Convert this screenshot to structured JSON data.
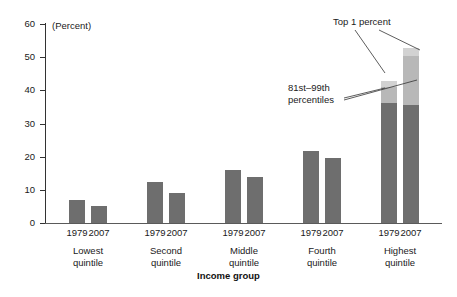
{
  "chart_data": {
    "type": "bar",
    "title": "",
    "subtitle": "",
    "unit_label": "(Percent)",
    "xlabel": "Income group",
    "ylabel": "",
    "ylim": [
      0,
      60
    ],
    "yticks": [
      0,
      10,
      20,
      30,
      40,
      50,
      60
    ],
    "ytick_labels": [
      "0",
      "10",
      "20",
      "30",
      "40",
      "50",
      "60"
    ],
    "grid": false,
    "legend_position": "annotations",
    "categories": [
      "Lowest quintile",
      "Second quintile",
      "Middle quintile",
      "Fourth quintile",
      "Highest quintile"
    ],
    "category_lines": [
      [
        "Lowest",
        "quintile"
      ],
      [
        "Second",
        "quintile"
      ],
      [
        "Middle",
        "quintile"
      ],
      [
        "Fourth",
        "quintile"
      ],
      [
        "Highest",
        "quintile"
      ]
    ],
    "year_labels": [
      "1979",
      "2007"
    ],
    "stack_segments": [
      "1st-80th percentiles",
      "81st-99th percentiles",
      "Top 1 percent"
    ],
    "annotations": [
      {
        "id": "top-1-percent",
        "text": "Top 1 percent"
      },
      {
        "id": "81st-99th-percentiles",
        "line1": "81st–99th",
        "line2": "percentiles"
      }
    ],
    "colors": {
      "base_segment": "#6e6e6e",
      "middle_segment": "#b8b8b8",
      "top_segment": "#d2d2d2",
      "axis": "#333333",
      "text": "#1a1a1a",
      "background": "#ffffff"
    },
    "bars": [
      {
        "group": "Lowest quintile",
        "year": "1979",
        "total": 7.0,
        "segments": [
          {
            "name": "1st-80th percentiles",
            "value": 7.0
          }
        ]
      },
      {
        "group": "Lowest quintile",
        "year": "2007",
        "total": 5.1,
        "segments": [
          {
            "name": "1st-80th percentiles",
            "value": 5.1
          }
        ]
      },
      {
        "group": "Second quintile",
        "year": "1979",
        "total": 12.3,
        "segments": [
          {
            "name": "1st-80th percentiles",
            "value": 12.3
          }
        ]
      },
      {
        "group": "Second quintile",
        "year": "2007",
        "total": 9.2,
        "segments": [
          {
            "name": "1st-80th percentiles",
            "value": 9.2
          }
        ]
      },
      {
        "group": "Middle quintile",
        "year": "1979",
        "total": 15.9,
        "segments": [
          {
            "name": "1st-80th percentiles",
            "value": 15.9
          }
        ]
      },
      {
        "group": "Middle quintile",
        "year": "2007",
        "total": 14.0,
        "segments": [
          {
            "name": "1st-80th percentiles",
            "value": 14.0
          }
        ]
      },
      {
        "group": "Fourth quintile",
        "year": "1979",
        "total": 21.8,
        "segments": [
          {
            "name": "1st-80th percentiles",
            "value": 21.8
          }
        ]
      },
      {
        "group": "Fourth quintile",
        "year": "2007",
        "total": 19.5,
        "segments": [
          {
            "name": "1st-80th percentiles",
            "value": 19.5
          }
        ]
      },
      {
        "group": "Highest quintile",
        "year": "1979",
        "total": 42.8,
        "segments": [
          {
            "name": "1st-80th percentiles",
            "value": 36.3
          },
          {
            "name": "81st-99th percentiles",
            "value": 4.8
          },
          {
            "name": "Top 1 percent",
            "value": 1.7
          }
        ]
      },
      {
        "group": "Highest quintile",
        "year": "2007",
        "total": 52.9,
        "segments": [
          {
            "name": "1st-80th percentiles",
            "value": 35.5
          },
          {
            "name": "81st-99th percentiles",
            "value": 15.0
          },
          {
            "name": "Top 1 percent",
            "value": 2.4
          }
        ]
      }
    ]
  }
}
